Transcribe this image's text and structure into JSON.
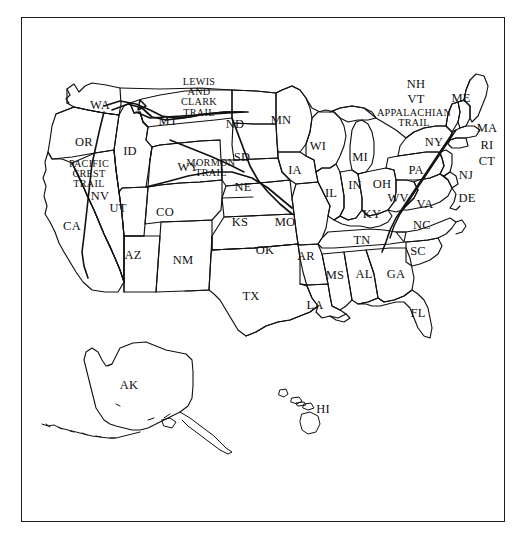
{
  "image": {
    "title": "United States map with state abbreviations and historic trails",
    "width": 523,
    "height": 544,
    "background_color": "#ffffff",
    "ink_color": "#111111",
    "frame": {
      "present": true,
      "border_color": "#1a1a1a",
      "x": 21,
      "y": 17,
      "width": 484,
      "height": 505
    }
  },
  "map": {
    "projection_note": "Contiguous United States with Alaska and Hawaii insets below",
    "line_style": "black outline, no fill",
    "state_labels": [
      {
        "abbr": "WA",
        "name": "Washington",
        "x": 100,
        "y": 105
      },
      {
        "abbr": "OR",
        "name": "Oregon",
        "x": 84,
        "y": 142
      },
      {
        "abbr": "ID",
        "name": "Idaho",
        "x": 130,
        "y": 151
      },
      {
        "abbr": "MT",
        "name": "Montana",
        "x": 168,
        "y": 121
      },
      {
        "abbr": "ND",
        "name": "North Dakota",
        "x": 235,
        "y": 124
      },
      {
        "abbr": "SD",
        "name": "South Dakota",
        "x": 242,
        "y": 157
      },
      {
        "abbr": "MN",
        "name": "Minnesota",
        "x": 281,
        "y": 120
      },
      {
        "abbr": "WI",
        "name": "Wisconsin",
        "x": 318,
        "y": 146
      },
      {
        "abbr": "MI",
        "name": "Michigan",
        "x": 360,
        "y": 157
      },
      {
        "abbr": "NY",
        "name": "New York",
        "x": 434,
        "y": 142
      },
      {
        "abbr": "ME",
        "name": "Maine",
        "x": 461,
        "y": 98
      },
      {
        "abbr": "NH",
        "name": "New Hampshire",
        "x": 416,
        "y": 84
      },
      {
        "abbr": "VT",
        "name": "Vermont",
        "x": 416,
        "y": 99
      },
      {
        "abbr": "MA",
        "name": "Massachusetts",
        "x": 487,
        "y": 128
      },
      {
        "abbr": "RI",
        "name": "Rhode Island",
        "x": 487,
        "y": 145
      },
      {
        "abbr": "CT",
        "name": "Connecticut",
        "x": 487,
        "y": 161
      },
      {
        "abbr": "NJ",
        "name": "New Jersey",
        "x": 466,
        "y": 175
      },
      {
        "abbr": "DE",
        "name": "Delaware",
        "x": 467,
        "y": 198
      },
      {
        "abbr": "PA",
        "name": "PA",
        "x": 416,
        "y": 170
      },
      {
        "abbr": "OH",
        "name": "Ohio",
        "x": 382,
        "y": 184
      },
      {
        "abbr": "IN",
        "name": "Indiana",
        "x": 355,
        "y": 185
      },
      {
        "abbr": "IL",
        "name": "Illinois",
        "x": 331,
        "y": 193
      },
      {
        "abbr": "WV",
        "name": "West Virginia",
        "x": 398,
        "y": 198
      },
      {
        "abbr": "VA",
        "name": "Virginia",
        "x": 425,
        "y": 204
      },
      {
        "abbr": "KY",
        "name": "Kentucky",
        "x": 372,
        "y": 214
      },
      {
        "abbr": "NC",
        "name": "North Carolina",
        "x": 422,
        "y": 225
      },
      {
        "abbr": "SC",
        "name": "South Carolina",
        "x": 418,
        "y": 251
      },
      {
        "abbr": "TN",
        "name": "Tennessee",
        "x": 362,
        "y": 240
      },
      {
        "abbr": "GA",
        "name": "Georgia",
        "x": 396,
        "y": 274
      },
      {
        "abbr": "AL",
        "name": "Alabama",
        "x": 364,
        "y": 274
      },
      {
        "abbr": "MS",
        "name": "Mississippi",
        "x": 335,
        "y": 275
      },
      {
        "abbr": "AR",
        "name": "Arkansas",
        "x": 306,
        "y": 256
      },
      {
        "abbr": "LA",
        "name": "Louisiana",
        "x": 315,
        "y": 305
      },
      {
        "abbr": "MO",
        "name": "Missouri",
        "x": 285,
        "y": 222
      },
      {
        "abbr": "IA",
        "name": "Iowa",
        "x": 295,
        "y": 170
      },
      {
        "abbr": "NE",
        "name": "Nebraska",
        "x": 243,
        "y": 187
      },
      {
        "abbr": "KS",
        "name": "Kansas",
        "x": 240,
        "y": 222
      },
      {
        "abbr": "OK",
        "name": "Oklahoma",
        "x": 265,
        "y": 250
      },
      {
        "abbr": "TX",
        "name": "Texas",
        "x": 251,
        "y": 296
      },
      {
        "abbr": "NM",
        "name": "New Mexico",
        "x": 183,
        "y": 260
      },
      {
        "abbr": "AZ",
        "name": "Arizona",
        "x": 133,
        "y": 255
      },
      {
        "abbr": "CO",
        "name": "Colorado",
        "x": 165,
        "y": 212
      },
      {
        "abbr": "UT",
        "name": "Utah",
        "x": 118,
        "y": 208
      },
      {
        "abbr": "NV",
        "name": "Nevada",
        "x": 100,
        "y": 196
      },
      {
        "abbr": "CA",
        "name": "California",
        "x": 72,
        "y": 226
      },
      {
        "abbr": "WY",
        "name": "Wyoming",
        "x": 188,
        "y": 167
      },
      {
        "abbr": "FL",
        "name": "Florida",
        "x": 418,
        "y": 313
      },
      {
        "abbr": "AK",
        "name": "Alaska",
        "x": 129,
        "y": 385
      },
      {
        "abbr": "HI",
        "name": "Hawaii",
        "x": 323,
        "y": 409
      }
    ],
    "trail_labels": [
      {
        "id": "lewis-and-clark-trail",
        "name": "Lewis and Clark Trail",
        "lines": [
          "LEWIS",
          "AND",
          "CLARK",
          "TRAIL"
        ],
        "x": 199,
        "y": 97
      },
      {
        "id": "mormon-trail",
        "name": "Mormon Trail",
        "lines": [
          "MORMON",
          "TRAIL"
        ],
        "x": 211,
        "y": 168
      },
      {
        "id": "pacific-crest-trail",
        "name": "Pacific Crest Trail",
        "lines": [
          "PACIFIC",
          "CREST",
          "TRAIL"
        ],
        "x": 89,
        "y": 174
      },
      {
        "id": "appalachian-trail",
        "name": "Appalachian Trail",
        "lines": [
          "APPALACHIAN",
          "TRAIL"
        ],
        "x": 414,
        "y": 118
      }
    ]
  }
}
